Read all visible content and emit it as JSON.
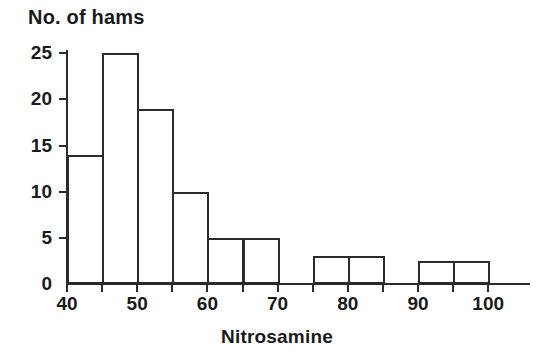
{
  "chart_data": {
    "type": "bar",
    "title": "No. of hams",
    "xlabel": "Nitrosamine",
    "ylabel": "",
    "grid": false,
    "legend": null,
    "xlim": [
      40,
      103
    ],
    "ylim": [
      0,
      26
    ],
    "x_ticks": [
      40,
      45,
      50,
      55,
      60,
      65,
      70,
      75,
      80,
      85,
      90,
      95,
      100
    ],
    "x_tick_labels": [
      "40",
      "",
      "50",
      "",
      "60",
      "",
      "70",
      "",
      "80",
      "",
      "90",
      "",
      "100"
    ],
    "y_ticks": [
      0,
      5,
      10,
      15,
      20,
      25
    ],
    "y_tick_labels": [
      "0",
      "5",
      "10",
      "15",
      "20",
      "25"
    ],
    "bin_width": 5,
    "categories": [
      "40-45",
      "45-50",
      "50-55",
      "55-60",
      "60-65",
      "65-70",
      "70-75",
      "75-80",
      "80-85",
      "85-90",
      "90-95",
      "95-100"
    ],
    "bins": [
      {
        "start": 40,
        "end": 45,
        "value": 14
      },
      {
        "start": 45,
        "end": 50,
        "value": 25
      },
      {
        "start": 50,
        "end": 55,
        "value": 19
      },
      {
        "start": 55,
        "end": 60,
        "value": 10
      },
      {
        "start": 60,
        "end": 65,
        "value": 5
      },
      {
        "start": 65,
        "end": 70,
        "value": 5
      },
      {
        "start": 70,
        "end": 75,
        "value": 0
      },
      {
        "start": 75,
        "end": 80,
        "value": 3
      },
      {
        "start": 80,
        "end": 85,
        "value": 3
      },
      {
        "start": 85,
        "end": 90,
        "value": 0
      },
      {
        "start": 90,
        "end": 95,
        "value": 2.5
      },
      {
        "start": 95,
        "end": 100,
        "value": 2.5
      }
    ],
    "values": [
      14,
      25,
      19,
      10,
      5,
      5,
      0,
      3,
      3,
      0,
      2.5,
      2.5
    ],
    "colors": {
      "bar_stroke": "#2b2b2b",
      "bar_fill": "none",
      "axis": "#2b2b2b",
      "text": "#1a1a1a",
      "background": "#ffffff"
    }
  }
}
